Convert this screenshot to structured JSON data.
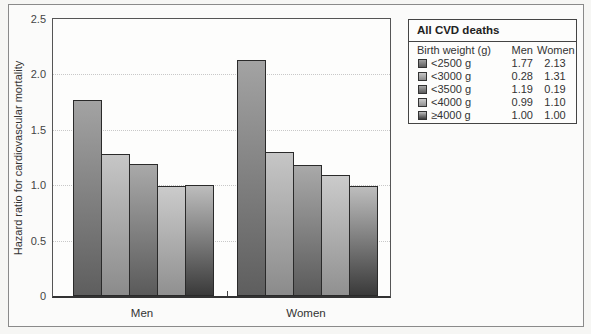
{
  "chart_data": {
    "type": "bar",
    "title": "",
    "xlabel": "",
    "ylabel": "Hazard ratio for cardiovascular mortality",
    "ylim": [
      0,
      2.5
    ],
    "yticks": [
      "0",
      "0.5",
      "1.0",
      "1.5",
      "2.0",
      "2.5"
    ],
    "grid": true,
    "categories": [
      "Men",
      "Women"
    ],
    "series": [
      {
        "name": "<2500 g",
        "values": [
          1.77,
          2.13
        ]
      },
      {
        "name": "<3000 g",
        "values": [
          1.28,
          1.3
        ]
      },
      {
        "name": "<3500 g",
        "values": [
          1.19,
          1.18
        ]
      },
      {
        "name": "<4000 g",
        "values": [
          0.99,
          1.09
        ]
      },
      {
        "name": "≥4000 g",
        "values": [
          1.0,
          0.99
        ]
      }
    ],
    "legend_position": "top-right",
    "legend": {
      "title": "All CVD deaths",
      "columns": [
        "Birth weight (g)",
        "Men",
        "Women"
      ],
      "rows": [
        {
          "label": "<2500 g",
          "men": "1.77",
          "women": "2.13"
        },
        {
          "label": "<3000 g",
          "men": "0.28",
          "women": "1.31"
        },
        {
          "label": "<3500 g",
          "men": "1.19",
          "women": "0.19"
        },
        {
          "label": "<4000 g",
          "men": "0.99",
          "women": "1.10"
        },
        {
          "label": "≥4000 g",
          "men": "1.00",
          "women": "1.00"
        }
      ]
    }
  }
}
